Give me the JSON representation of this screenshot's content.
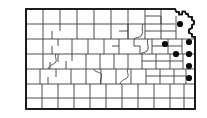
{
  "figure": {
    "type": "county-distribution-map",
    "title": "Kansas county distribution map",
    "state": "Kansas",
    "background_color": "#ffffff",
    "county_line_color": "#3a3a3a",
    "state_outline_color": "#111111",
    "dot_color": "#0a0a0a",
    "dot_radius_px": 3.1,
    "county_count_label": "105",
    "marked_county_count_label": "7"
  },
  "legend": {
    "dot_meaning": "county record",
    "visible": false
  },
  "chart_data": {
    "type": "map",
    "title": "Kansas county distribution map",
    "region": "Kansas",
    "marker_type": "filled-circle",
    "marker_color": "#0a0a0a",
    "grid": "on",
    "xlim": [
      0,
      207
    ],
    "ylim": [
      0,
      118
    ],
    "markers": [
      {
        "id": "dot-1",
        "label": "northeast-corner-county",
        "x": 180.0,
        "y": 24.0
      },
      {
        "id": "dot-2",
        "label": "east-central-north-county",
        "x": 165.0,
        "y": 44.0
      },
      {
        "id": "dot-3",
        "label": "east-edge-county-row3",
        "x": 189.0,
        "y": 42.0
      },
      {
        "id": "dot-4",
        "label": "east-inner-county-row4",
        "x": 176.0,
        "y": 54.0
      },
      {
        "id": "dot-5",
        "label": "east-edge-county-row4",
        "x": 189.0,
        "y": 54.0
      },
      {
        "id": "dot-6",
        "label": "east-edge-county-row5",
        "x": 189.0,
        "y": 66.0
      },
      {
        "id": "dot-7",
        "label": "east-edge-county-row6",
        "x": 189.0,
        "y": 78.0
      }
    ]
  },
  "map_geometry": {
    "state_border_path": "M26,9 L175,9 L176.5,12 L179,12 L179,14.5 L182,14.5 L182.5,11.5 L185,11.5 L186,14 L188,14 L188.5,16.5 L192,17 L192,20 L194,21 L194,24 L192,25 L192,28 L189,29.5 L189,33 L192,34 L192,36.5 L195,37 L195,109 L26,109 Z",
    "interior_lines": [
      "M26,24 L175,24",
      "M26,39 L195,39",
      "M26,54 L195,54",
      "M26,69 L195,69",
      "M26,84 L195,84",
      "M26,98 L195,98",
      "M43,9 L43,24",
      "M60,9 L60,24",
      "M77,9 L77,24",
      "M94,9 L94,24",
      "M111,9 L111,24",
      "M128,9 L128,24",
      "M145,9 L145,24",
      "M161,9 L161,24",
      "M43,24 L43,39",
      "M60,24 L60,31",
      "M52,31 L52,39",
      "M77,24 L77,39",
      "M94,24 L94,39",
      "M111,24 L111,39",
      "M128,24 L128,39",
      "M145,24 L145,39",
      "M161,24 L161,39",
      "M176,24 L176,39",
      "M43,39 L43,54",
      "M58,39 L58,46",
      "M52,46 L52,54",
      "M72,39 L72,54",
      "M88,39 L88,54",
      "M104,39 L104,54",
      "M119,39 L119,54",
      "M134,39 L134,46",
      "M140,46 L140,54",
      "M152,39 L152,54",
      "M168,39 L168,54",
      "M182,39 L182,54",
      "M43,54 L43,69",
      "M58,54 L58,62",
      "M50,62 L50,69",
      "M72,54 L72,61",
      "M66,61 L66,69",
      "M86,54 L86,69",
      "M100,54 L100,69",
      "M114,54 L114,69",
      "M128,54 L128,69",
      "M142,54 L142,69",
      "M156,54 L156,69",
      "M170,54 L170,69",
      "M183,54 L183,69",
      "M40,69 L40,84",
      "M56,69 L56,77",
      "M48,77 L48,84",
      "M71,69 L71,84",
      "M86,69 L86,84",
      "M101,69 L101,84",
      "M116,69 L116,84",
      "M131,69 L131,84",
      "M146,69 L146,84",
      "M160,69 L160,84",
      "M174,69 L174,84",
      "M186,69 L186,84",
      "M42,84 L42,98",
      "M58,84 L58,98",
      "M74,84 L74,98",
      "M90,84 L90,98",
      "M106,84 L106,98",
      "M122,84 L122,98",
      "M138,84 L138,98",
      "M154,84 L154,98",
      "M170,84 L170,98",
      "M184,84 L184,98",
      "M42,98 L42,109",
      "M58,98 L58,109",
      "M74,98 L74,109",
      "M90,98 L90,109",
      "M106,98 L106,109",
      "M122,98 L122,109",
      "M138,98 L138,109",
      "M154,98 L154,109",
      "M170,98 L170,109",
      "M184,98 L184,109",
      "M128,24 L128,39",
      "M112,46 L119,46",
      "M134,46 L140,46",
      "M119,31 L128,31",
      "M145,16 L161,16",
      "M161,16 L161,24",
      "M145,31 L161,31",
      "M161,31 L176,31",
      "M176,16 L176,24",
      "M168,46 L182,46",
      "M152,46 L168,46",
      "M142,61 L156,61",
      "M156,61 L170,61",
      "M170,61 L183,61",
      "M160,76 L174,76",
      "M174,76 L186,76",
      "M146,76 L160,76"
    ],
    "irregular_borders": [
      "M143,24 C141,28 144,32 141,36 C139,38 136,37 134,39",
      "M148,39 C146,43 150,47 147,51 C145,53 142,52 141,54",
      "M128,69 C126,72 130,75 127,78 C125,80 122,79 120,84",
      "M56,54 C54,57 58,60 55,63 C53,65 50,64 48,69",
      "M94,69 C95,73 99,71 101,74 C103,77 99,80 101,84"
    ]
  }
}
